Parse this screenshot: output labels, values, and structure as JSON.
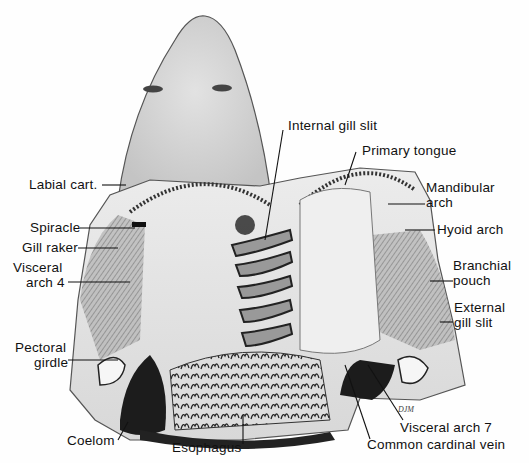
{
  "figure": {
    "signature": "DJM"
  },
  "labels": {
    "labial_cart": "Labial cart.",
    "spiracle": "Spiracle",
    "gill_raker": "Gill raker",
    "visceral_arch_4_line1": "Visceral",
    "visceral_arch_4_line2": "arch 4",
    "pectoral_girdle_line1": "Pectoral",
    "pectoral_girdle_line2": "girdle",
    "coelom": "Coelom",
    "esophagus": "Esophagus",
    "internal_gill_slit": "Internal gill slit",
    "primary_tongue": "Primary tongue",
    "mandibular_arch_line1": "Mandibular",
    "mandibular_arch_line2": "arch",
    "hyoid_arch": "Hyoid arch",
    "branchial_pouch_line1": "Branchial",
    "branchial_pouch_line2": "pouch",
    "external_gill_slit_line1": "External",
    "external_gill_slit_line2": "gill slit",
    "visceral_arch_7": "Visceral arch 7",
    "common_cardinal_vein": "Common cardinal vein"
  },
  "colors": {
    "tissue_light": "#e6e6e6",
    "tissue_mid": "#c8c8c8",
    "tissue_dark": "#8a8a8a",
    "cavity": "#1c1c1c",
    "line": "#111111"
  }
}
